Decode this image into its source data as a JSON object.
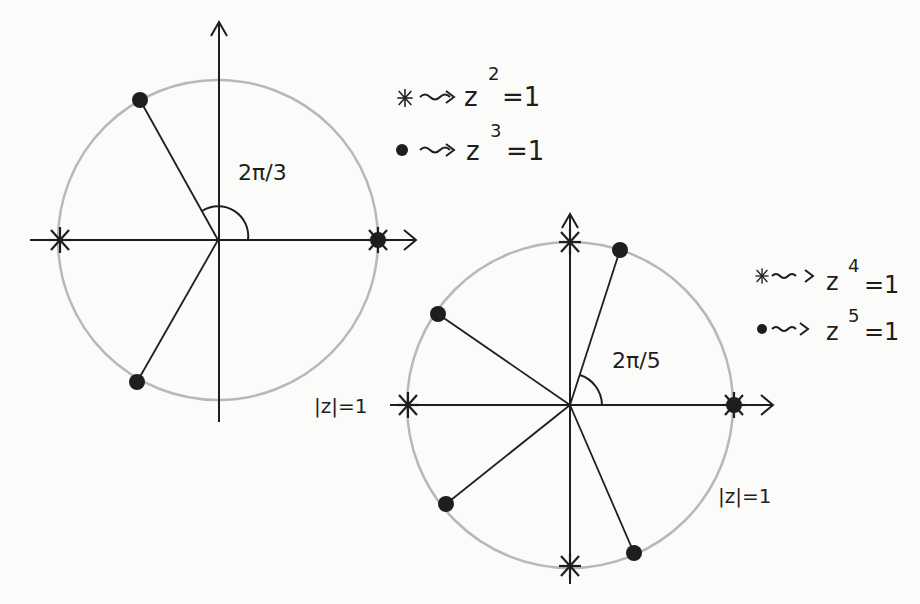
{
  "diagram": {
    "colors": {
      "ink": "#1e1e1e",
      "circle": "#b8b8b8",
      "background": "#fbfbf9"
    },
    "left": {
      "center": [
        218,
        240
      ],
      "radius": 160,
      "angle_label": "2π/3",
      "legend": [
        {
          "marker": "star",
          "text": "z",
          "exp": "2",
          "rhs": "=1"
        },
        {
          "marker": "dot",
          "text": "z",
          "exp": "3",
          "rhs": "=1"
        }
      ],
      "circle_label": "|z|=1"
    },
    "right": {
      "center": [
        570,
        405
      ],
      "radius": 163,
      "angle_label": "2π/5",
      "legend": [
        {
          "marker": "star",
          "text": "z",
          "exp": "4",
          "rhs": "=1"
        },
        {
          "marker": "dot",
          "text": "z",
          "exp": "5",
          "rhs": "=1"
        }
      ],
      "circle_label": "|z|=1"
    }
  }
}
